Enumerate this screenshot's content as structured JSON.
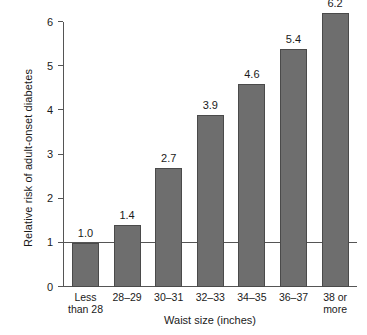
{
  "chart_data": {
    "type": "bar",
    "title": "",
    "subtitle": "",
    "xlabel": "Waist size (inches)",
    "ylabel": "Relative risk of adult-onset diabetes",
    "categories": [
      "Less\nthan 28",
      "28–29",
      "30–31",
      "32–33",
      "34–35",
      "36–37",
      "38 or\nmore"
    ],
    "category_lines": [
      [
        "Less",
        "than 28"
      ],
      [
        "28–29"
      ],
      [
        "30–31"
      ],
      [
        "32–33"
      ],
      [
        "34–35"
      ],
      [
        "36–37"
      ],
      [
        "38 or",
        "more"
      ]
    ],
    "values": [
      1.0,
      1.4,
      2.7,
      3.9,
      4.6,
      5.4,
      6.2
    ],
    "value_labels": [
      "1.0",
      "1.4",
      "2.7",
      "3.9",
      "4.6",
      "5.4",
      "6.2"
    ],
    "ylim": [
      0,
      6
    ],
    "ytick_values": [
      0,
      1,
      2,
      3,
      4,
      5,
      6
    ],
    "ytick_labels": [
      "0",
      "1",
      "2",
      "3",
      "4",
      "5",
      "6"
    ],
    "grid": false,
    "legend": null,
    "reference_line": {
      "value": 1,
      "label": ""
    },
    "colors": {
      "bar_fill": "#6e6e6e",
      "bar_border": "#4a4a4a",
      "axis": "#555555",
      "text": "#1a1a1a",
      "background": "#ffffff"
    }
  }
}
